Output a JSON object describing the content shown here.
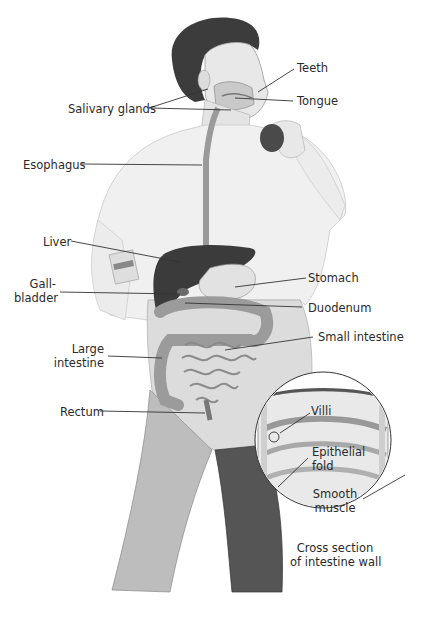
{
  "diagram": {
    "labels": {
      "teeth": "Teeth",
      "tongue": "Tongue",
      "salivary_glands": "Salivary glands",
      "esophagus": "Esophagus",
      "liver": "Liver",
      "gallbladder_line1": "Gall-",
      "gallbladder_line2": "bladder",
      "stomach": "Stomach",
      "duodenum": "Duodenum",
      "small_intestine": "Small intestine",
      "large_intestine_line1": "Large",
      "large_intestine_line2": "intestine",
      "rectum": "Rectum"
    },
    "inset": {
      "villi": "Villi",
      "epithelial_fold_line1": "Epithelial",
      "epithelial_fold_line2": "fold",
      "smooth_muscle_line1": "Smooth",
      "smooth_muscle_line2": "muscle",
      "caption_line1": "Cross section",
      "caption_line2": "of intestine wall"
    },
    "colors": {
      "background": "#ffffff",
      "text": "#2a2a2a",
      "leader_line": "#333333",
      "organ_dark": "#3a3a3a",
      "skin_light": "#e4e4e4",
      "pants": "#5a5a5a"
    }
  }
}
